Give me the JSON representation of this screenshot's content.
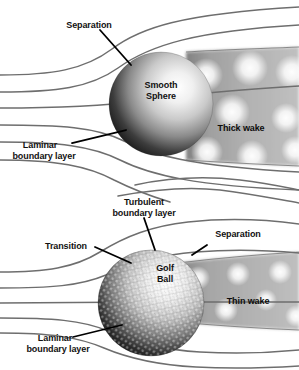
{
  "figure": {
    "title_visible": false,
    "panels": [
      {
        "id": "smooth-sphere-panel",
        "subject": "Smooth Sphere",
        "labels": {
          "separation": "Separation",
          "body": "Smooth\nSphere",
          "body_line1": "Smooth",
          "body_line2": "Sphere",
          "wake": "Thick wake",
          "boundary_layer_line1": "Laminar",
          "boundary_layer_line2": "boundary layer"
        }
      },
      {
        "id": "golf-ball-panel",
        "subject": "Golf Ball",
        "labels": {
          "turbulent_line1": "Turbulent",
          "turbulent_line2": "boundary layer",
          "transition": "Transition",
          "separation": "Separation",
          "body_line1": "Golf",
          "body_line2": "Ball",
          "wake": "Thin wake",
          "boundary_layer_line1": "Laminar",
          "boundary_layer_line2": "boundary layer"
        }
      }
    ],
    "colors": {
      "background": "#ffffff",
      "streamline": "#6e6e6e",
      "leader": "#000000",
      "text": "#111111",
      "wake_gray": "#a8a8a8",
      "wake_eddy": "#f2f2f2",
      "sphere_dark": "#050505",
      "sphere_light": "#f4f4f4"
    }
  }
}
